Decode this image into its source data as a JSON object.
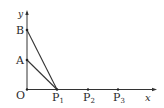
{
  "diagram": {
    "type": "coordinate-geometry",
    "axes": {
      "x_label": "x",
      "y_label": "y",
      "origin_label": "O"
    },
    "points": [
      {
        "name": "O",
        "label": "O",
        "sub": ""
      },
      {
        "name": "A",
        "label": "A",
        "sub": ""
      },
      {
        "name": "B",
        "label": "B",
        "sub": ""
      },
      {
        "name": "P1",
        "label": "P",
        "sub": "1"
      },
      {
        "name": "P2",
        "label": "P",
        "sub": "2"
      },
      {
        "name": "P3",
        "label": "P",
        "sub": "3"
      }
    ],
    "segments": [
      "A-P1",
      "B-P1"
    ],
    "colors": {
      "line": "#333333",
      "text": "#2a2a2a",
      "background": "#ffffff"
    }
  }
}
